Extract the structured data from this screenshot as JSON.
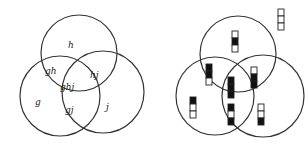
{
  "left_diagram": {
    "title": "Venn regions labeled",
    "circles": [
      {
        "name": "h",
        "cx": 79,
        "cy": 53,
        "r": 38
      },
      {
        "name": "g",
        "cx": 60,
        "cy": 96,
        "r": 40
      },
      {
        "name": "j",
        "cx": 103,
        "cy": 92,
        "r": 41
      }
    ],
    "labels": [
      {
        "text": "h",
        "x": 68,
        "y": 48
      },
      {
        "text": "gh",
        "x": 45,
        "y": 74
      },
      {
        "text": "hj",
        "x": 90,
        "y": 78
      },
      {
        "text": "ghj",
        "x": 60,
        "y": 90
      },
      {
        "text": "g",
        "x": 35,
        "y": 105
      },
      {
        "text": "gj",
        "x": 65,
        "y": 113
      },
      {
        "text": "j",
        "x": 106,
        "y": 110
      }
    ]
  },
  "right_diagram": {
    "circles": [
      {
        "name": "h",
        "cx": 238,
        "cy": 54,
        "r": 38
      },
      {
        "name": "g",
        "cx": 215,
        "cy": 96,
        "r": 39
      },
      {
        "name": "j",
        "cx": 263,
        "cy": 96,
        "r": 41
      }
    ],
    "legend_bar": {
      "x": 278,
      "y": 9,
      "cells": [
        false,
        false,
        false
      ]
    },
    "bars": [
      {
        "region": "h",
        "x": 232,
        "y": 31,
        "cells": [
          false,
          true,
          false
        ]
      },
      {
        "region": "gh",
        "x": 206,
        "y": 64,
        "cells": [
          true,
          true,
          false
        ]
      },
      {
        "region": "hj",
        "x": 251,
        "y": 67,
        "cells": [
          false,
          true,
          true
        ]
      },
      {
        "region": "ghj",
        "x": 228,
        "y": 77,
        "cells": [
          true,
          true,
          true
        ]
      },
      {
        "region": "g",
        "x": 190,
        "y": 97,
        "cells": [
          true,
          false,
          false
        ]
      },
      {
        "region": "gj",
        "x": 228,
        "y": 104,
        "cells": [
          true,
          false,
          true
        ]
      },
      {
        "region": "j",
        "x": 258,
        "y": 104,
        "cells": [
          false,
          false,
          true
        ]
      }
    ]
  }
}
